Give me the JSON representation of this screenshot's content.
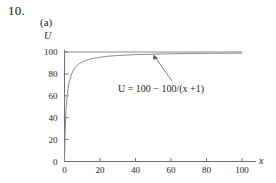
{
  "figure": {
    "problem_number": "10.",
    "part_label": "(a)"
  },
  "chart_data": {
    "type": "line",
    "title": "",
    "subtitle": "",
    "xlabel": "x",
    "ylabel": "U",
    "equation_label": "U = 100 − 100/(x +1)",
    "equation_parts": {
      "lhs": "U",
      "equals": "=",
      "rhs": "100 − 100/(x +1)"
    },
    "xlim": [
      0,
      100
    ],
    "ylim": [
      0,
      100
    ],
    "xticks": [
      0,
      20,
      40,
      60,
      80,
      100
    ],
    "xtick_labels": [
      "0",
      "20",
      "40",
      "60",
      "80",
      "100"
    ],
    "yticks": [
      0,
      20,
      40,
      60,
      80,
      100
    ],
    "ytick_labels": [
      "0",
      "20",
      "40",
      "60",
      "80",
      "100"
    ],
    "grid": false,
    "legend": null,
    "series": [
      {
        "name": "U = 100 - 100/(x+1)",
        "color": "#8a8a8a",
        "x": [
          0,
          0.25,
          0.5,
          0.75,
          1,
          1.5,
          2,
          2.5,
          3,
          4,
          5,
          6,
          7,
          8,
          9,
          10,
          12,
          14,
          16,
          18,
          20,
          25,
          30,
          35,
          40,
          50,
          60,
          70,
          80,
          90,
          100
        ],
        "values": [
          0,
          20,
          33.3,
          42.9,
          50,
          60,
          66.7,
          71.4,
          75,
          80,
          83.3,
          85.7,
          87.5,
          88.9,
          90,
          90.9,
          92.3,
          93.3,
          94.1,
          94.7,
          95.2,
          96.2,
          96.8,
          97.2,
          97.6,
          98,
          98.4,
          98.6,
          98.8,
          98.9,
          99
        ]
      },
      {
        "name": "asymptote U = 100",
        "color": "#8a8a8a",
        "x": [
          0,
          100
        ],
        "values": [
          100,
          100
        ]
      }
    ],
    "annotations": [
      {
        "text": "U = 100 − 100/(x +1)",
        "points_to_x": 37,
        "points_to_y": 97.5
      }
    ]
  }
}
